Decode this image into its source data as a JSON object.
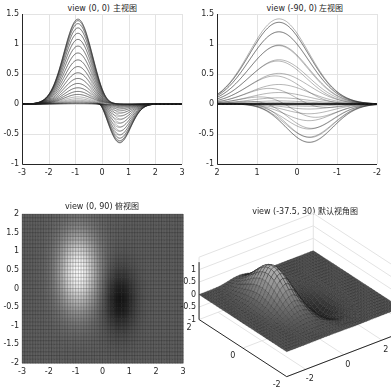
{
  "figure": {
    "background": "#ffffff",
    "axis_color": "#262626",
    "grid_color": "#e3e3e3",
    "surface_function": "z = 2*(x+0.3*y)*exp(-(x^2+y^2)/1.2)... (mesh of a bipolar Gaussian surface)"
  },
  "chart_data": [
    {
      "type": "surface",
      "title": "view (0, 0)  主视图",
      "view": [
        0,
        0
      ],
      "xlim": [
        -3,
        3
      ],
      "ylim": [
        -1,
        1.5
      ],
      "xticks": [
        "-3",
        "-2",
        "-1",
        "0",
        "1",
        "2",
        "3"
      ],
      "yticks": [
        "-1",
        "-0.5",
        "0",
        "0.5",
        "1",
        "1.5"
      ],
      "grid": true,
      "peak": {
        "x": -0.9,
        "z": 1.42
      },
      "trough": {
        "x": 0.65,
        "z": -0.64
      }
    },
    {
      "type": "surface",
      "title": "view (-90, 0)  左视图",
      "view": [
        -90,
        0
      ],
      "xlim": [
        2,
        -2
      ],
      "ylim": [
        -1,
        1.5
      ],
      "xticks": [
        "2",
        "1",
        "0",
        "-1",
        "-2"
      ],
      "yticks": [
        "-1",
        "-0.5",
        "0",
        "0.5",
        "1",
        "1.5"
      ],
      "grid": true,
      "peak": {
        "y": 0.5,
        "z": 1.42
      },
      "trough": {
        "y": -0.3,
        "z": -0.64
      }
    },
    {
      "type": "heatmap",
      "title": "view (0, 90)  俯视图",
      "view": [
        0,
        90
      ],
      "xlim": [
        -3,
        3
      ],
      "ylim": [
        -2,
        2
      ],
      "xticks": [
        "-3",
        "-2",
        "-1",
        "0",
        "1",
        "2",
        "3"
      ],
      "yticks": [
        "-2",
        "-1.5",
        "-1",
        "-0.5",
        "0",
        "0.5",
        "1",
        "1.5",
        "2"
      ],
      "grid": false,
      "bright_spot": {
        "x": -0.9,
        "y": 0.5
      },
      "dark_spot": {
        "x": 0.7,
        "y": -0.3
      }
    },
    {
      "type": "surface3d",
      "title": "view (-37.5, 30)  默认视角图",
      "view": [
        -37.5,
        30
      ],
      "xlim": [
        -3,
        3
      ],
      "ylim": [
        -2,
        2
      ],
      "zlim": [
        -1,
        1.5
      ],
      "xticks": [
        "-2",
        "0",
        "2"
      ],
      "yticks": [
        "2",
        "0",
        "-2"
      ],
      "zticks": [
        "-1",
        "-0.5",
        "0",
        "0.5",
        "1"
      ],
      "grid": true
    }
  ]
}
